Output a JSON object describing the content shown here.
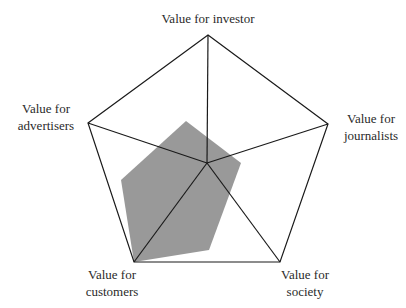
{
  "chart_data": {
    "type": "radar",
    "title": "",
    "axes": [
      "Value for investor",
      "Value for journalists",
      "Value for society",
      "Value for customers",
      "Value for advertisers"
    ],
    "axis_label_lines": [
      [
        "Value for investor"
      ],
      [
        "Value for",
        "journalists"
      ],
      [
        "Value for",
        "society"
      ],
      [
        "Value for",
        "customers"
      ],
      [
        "Value for",
        "advertisers"
      ]
    ],
    "range": [
      0,
      1
    ],
    "gridlines": "outer pentagon only",
    "series": [
      {
        "name": "Shaded profile",
        "fill_color": "#999999",
        "polygon_points_px": [
          [
            186,
            121
          ],
          [
            241,
            163
          ],
          [
            209,
            250
          ],
          [
            134,
            262
          ],
          [
            121,
            180
          ]
        ],
        "approx_values": {
          "Value for investor": 0.35,
          "Value for journalists": 0.3,
          "Value for society": 0.45,
          "Value for customers": 1.0,
          "Value for advertisers": 0.5
        }
      }
    ],
    "legend": "none"
  },
  "geometry": {
    "center": [
      207,
      163
    ],
    "outer_vertices": [
      [
        208,
        35
      ],
      [
        328,
        124
      ],
      [
        280,
        262
      ],
      [
        134,
        262
      ],
      [
        88,
        123
      ]
    ],
    "shaded_points": "186,121 241,163 209,250 134,262 121,180",
    "outer_points": "208,35 328,124 280,262 134,262 88,123",
    "line_color": "#1a1a1a",
    "fill_color": "#999999"
  },
  "labels": {
    "investor": {
      "line1": "Value for investor"
    },
    "journalists": {
      "line1": "Value for",
      "line2": "journalists"
    },
    "society": {
      "line1": "Value for",
      "line2": "society"
    },
    "customers": {
      "line1": "Value for",
      "line2": "customers"
    },
    "advertisers": {
      "line1": "Value for",
      "line2": "advertisers"
    }
  }
}
